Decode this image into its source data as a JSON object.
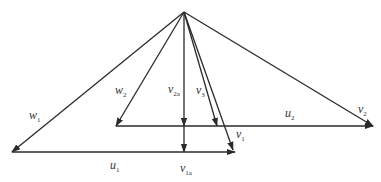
{
  "diagram": {
    "apex": [
      184,
      12
    ],
    "vectors": [
      {
        "id": "w1",
        "label": "w",
        "sub": "1",
        "from": [
          184,
          12
        ],
        "to": [
          12,
          152
        ]
      },
      {
        "id": "w2",
        "label": "w",
        "sub": "2",
        "from": [
          184,
          12
        ],
        "to": [
          116,
          126
        ]
      },
      {
        "id": "v2a",
        "label": "v",
        "sub": "2a",
        "from": [
          184,
          12
        ],
        "to": [
          184,
          126
        ]
      },
      {
        "id": "v1a",
        "label": "v",
        "sub": "1a",
        "from": [
          184,
          126
        ],
        "to": [
          184,
          152
        ]
      },
      {
        "id": "v3",
        "label": "v",
        "sub": "3",
        "from": [
          184,
          12
        ],
        "to": [
          217,
          126
        ]
      },
      {
        "id": "v1",
        "label": "v",
        "sub": "1",
        "from": [
          184,
          12
        ],
        "to": [
          233,
          150
        ]
      },
      {
        "id": "v2",
        "label": "v",
        "sub": "2",
        "from": [
          184,
          12
        ],
        "to": [
          373,
          126
        ]
      },
      {
        "id": "u2",
        "label": "u",
        "sub": "2",
        "from": [
          116,
          126
        ],
        "to": [
          373,
          126
        ]
      },
      {
        "id": "u1",
        "label": "u",
        "sub": "1",
        "from": [
          12,
          152
        ],
        "to": [
          235,
          152
        ]
      }
    ],
    "labels": {
      "w1": {
        "base": "w",
        "sub": "1"
      },
      "w2": {
        "base": "w",
        "sub": "2"
      },
      "v2a": {
        "base": "v",
        "sub": "2a"
      },
      "v3": {
        "base": "v",
        "sub": "3"
      },
      "v1": {
        "base": "v",
        "sub": "1"
      },
      "v2": {
        "base": "v",
        "sub": "2"
      },
      "u2": {
        "base": "u",
        "sub": "2"
      },
      "u1": {
        "base": "u",
        "sub": "1"
      },
      "v1a": {
        "base": "v",
        "sub": "1a"
      }
    }
  }
}
